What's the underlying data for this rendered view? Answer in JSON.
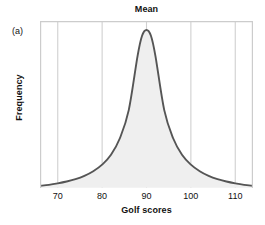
{
  "panel": {
    "label": "(a)"
  },
  "chart_data": {
    "type": "area",
    "title": "Mean",
    "subtitle": "",
    "xlabel": "Golf scores",
    "ylabel": "Frequency",
    "xlim": [
      66,
      114
    ],
    "ylim": [
      0,
      1
    ],
    "grid": true,
    "grid_axis": "x",
    "legend": "none",
    "annotations": [
      {
        "text": "Mean",
        "x": 90,
        "note": "title marks the mean of the distribution, aligned with the center gridline and the curve peak"
      }
    ],
    "xticks": [
      70,
      80,
      90,
      100,
      110
    ],
    "xtick_labels": [
      "70",
      "80",
      "90",
      "100",
      "110"
    ],
    "yticks": [],
    "ytick_labels": [],
    "series": [
      {
        "name": "Golf score distribution",
        "shape": "symmetric leptokurtic bell curve (peaked with heavy tails)",
        "mean": 90,
        "peak_x": 90,
        "peak_y": 0.955,
        "x": [
          66,
          68,
          70,
          72,
          74,
          76,
          78,
          80,
          82,
          84,
          86,
          88,
          89,
          90,
          91,
          92,
          94,
          96,
          98,
          100,
          102,
          104,
          106,
          108,
          110,
          112,
          114
        ],
        "y": [
          0.012,
          0.018,
          0.027,
          0.038,
          0.052,
          0.072,
          0.1,
          0.14,
          0.2,
          0.3,
          0.47,
          0.8,
          0.92,
          0.955,
          0.92,
          0.8,
          0.47,
          0.3,
          0.2,
          0.14,
          0.1,
          0.072,
          0.052,
          0.038,
          0.027,
          0.018,
          0.012
        ]
      }
    ],
    "colors": {
      "curve_stroke": "#555555",
      "area_fill": "#efefef",
      "gridline": "#d0d0d0",
      "frame": "#cccccc",
      "text": "#111111",
      "background": "#ffffff"
    }
  }
}
